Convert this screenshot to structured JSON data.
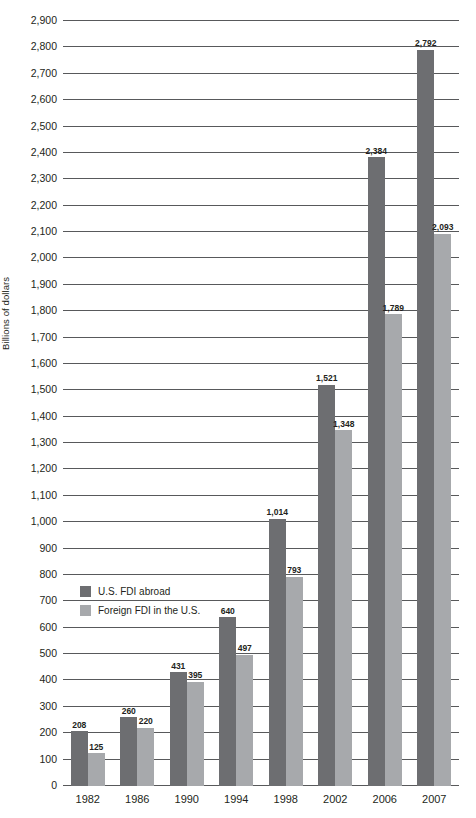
{
  "chart_data": {
    "type": "bar",
    "title": "",
    "subtitle": "",
    "xlabel": "",
    "ylabel": "Billions of dollars",
    "ylim": [
      0,
      2900
    ],
    "ytick_step": 100,
    "grid": true,
    "legend_position": "inside-left",
    "categories": [
      "1982",
      "1986",
      "1990",
      "1994",
      "1998",
      "2002",
      "2006",
      "2007"
    ],
    "ytick_labels": [
      "0",
      "100",
      "200",
      "300",
      "400",
      "500",
      "600",
      "700",
      "800",
      "900",
      "1,000",
      "1,100",
      "1,200",
      "1,300",
      "1,400",
      "1,500",
      "1,600",
      "1,700",
      "1,800",
      "1,900",
      "2,000",
      "2,100",
      "2,200",
      "2,300",
      "2,400",
      "2,500",
      "2,600",
      "2,700",
      "2,800",
      "2,900"
    ],
    "ytick_values": [
      0,
      100,
      200,
      300,
      400,
      500,
      600,
      700,
      800,
      900,
      1000,
      1100,
      1200,
      1300,
      1400,
      1500,
      1600,
      1700,
      1800,
      1900,
      2000,
      2100,
      2200,
      2300,
      2400,
      2500,
      2600,
      2700,
      2800,
      2900
    ],
    "series": [
      {
        "name": "U.S. FDI abroad",
        "color": "#6d6e71",
        "values": [
          208,
          260,
          431,
          640,
          1014,
          1521,
          2384,
          2792
        ],
        "labels": [
          "208",
          "260",
          "431",
          "640",
          "1,014",
          "1,521",
          "2,384",
          "2,792"
        ]
      },
      {
        "name": "Foreign FDI in the U.S.",
        "color": "#a7a9ac",
        "values": [
          125,
          220,
          395,
          497,
          793,
          1348,
          1789,
          2093
        ],
        "labels": [
          "125",
          "220",
          "395",
          "497",
          "793",
          "1,348",
          "1,789",
          "2,093"
        ]
      }
    ]
  },
  "legend": {
    "items": [
      {
        "label": "U.S. FDI abroad",
        "color": "#6d6e71"
      },
      {
        "label": "Foreign FDI in the U.S.",
        "color": "#a7a9ac"
      }
    ]
  },
  "colors": {
    "series_dark": "#6d6e71",
    "series_light": "#a7a9ac",
    "gridline": "#58595b",
    "text": "#231f20",
    "background": "#ffffff"
  }
}
